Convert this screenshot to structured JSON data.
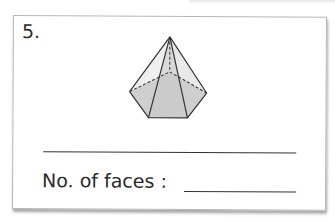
{
  "worksheet": {
    "question_number": "5.",
    "figure": {
      "name": "pentagonal pyramid",
      "fill_base_color": "#cccccc",
      "fill_side_color": "#ececec",
      "stroke_color": "#333333"
    },
    "answer_blank": "",
    "faces_label": "No. of faces :",
    "faces_value": ""
  }
}
